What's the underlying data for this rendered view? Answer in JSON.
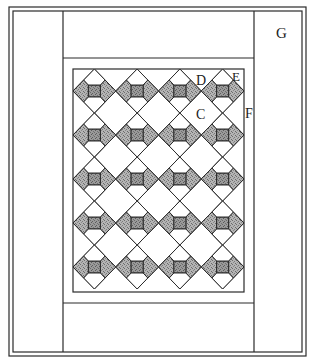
{
  "diagram": {
    "type": "quilt-layout",
    "labels": {
      "C": "C",
      "D": "D",
      "E": "E",
      "F": "F",
      "G": "G"
    },
    "grid": {
      "rows": 5,
      "columns": 4
    },
    "colors": {
      "line": "#2a2a2a",
      "background": "#ffffff",
      "shade": "#a9a9a9",
      "shade_center": "#8f8f8f"
    }
  }
}
